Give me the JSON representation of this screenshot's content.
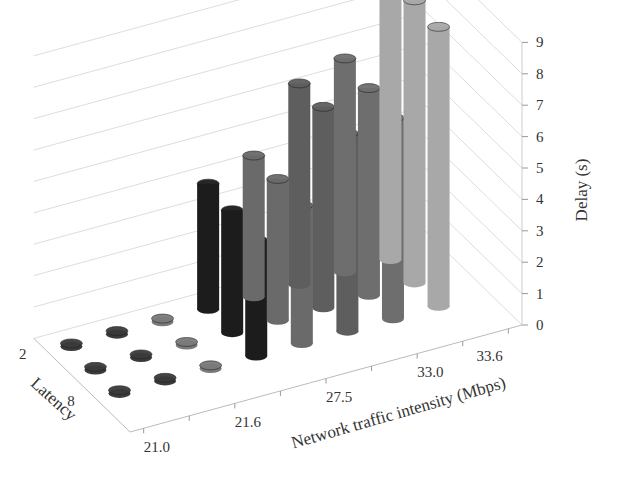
{
  "chart_data": {
    "type": "bar",
    "subtype": "3d-column",
    "title": "",
    "xlabel": "Network traffic intensity (Mbps)",
    "ylabel": "Latency",
    "zlabel": "Delay (s)",
    "x_tick_labels": [
      "21.0",
      "21.6",
      "27.5",
      "33.0",
      "33.6"
    ],
    "categories": [
      "c1",
      "c2",
      "21.6",
      "c4",
      "27.5",
      "c6",
      "33.0",
      "33.6"
    ],
    "y_tick_labels": [
      "2",
      "8"
    ],
    "z_ticks": [
      "0",
      "1",
      "2",
      "3",
      "4",
      "5",
      "6",
      "7",
      "8",
      "9"
    ],
    "zlim": [
      0,
      9
    ],
    "grid": true,
    "series": [
      {
        "name": "Latency 2",
        "values": [
          0.1,
          0.1,
          0.1,
          4.0,
          4.5,
          6.4,
          6.8,
          9.1
        ]
      },
      {
        "name": "Latency 5",
        "values": [
          0.1,
          0.1,
          0.1,
          3.9,
          4.5,
          6.4,
          6.6,
          9.0
        ]
      },
      {
        "name": "Latency 8",
        "values": [
          0.1,
          0.1,
          0.1,
          3.7,
          4.4,
          6.3,
          6.4,
          8.9
        ]
      }
    ],
    "bar_colors": [
      "#3a3a3a",
      "#3a3a3a",
      "#7a7a7a",
      "#1c1c1c",
      "#6a6a6a",
      "#5e5e5e",
      "#6e6e6e",
      "#a8a8a8"
    ]
  }
}
